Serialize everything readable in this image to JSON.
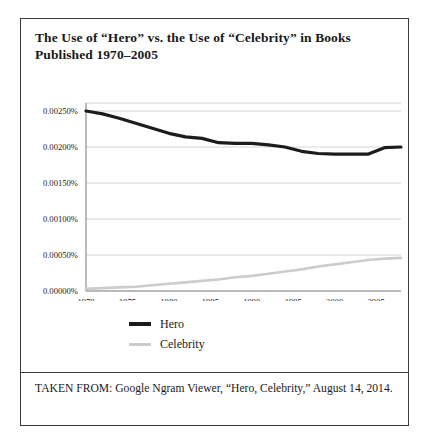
{
  "figure": {
    "title": "The Use of “Hero” vs. the Use of “Celebrity” in Books Published 1970–2005",
    "source_note": "TAKEN FROM: Google Ngram Viewer, “Hero, Celebrity,” August 14, 2014."
  },
  "legend": {
    "items": [
      {
        "label": "Hero",
        "color": "#1c1c1c"
      },
      {
        "label": "Celebrity",
        "color": "#cccccc"
      }
    ]
  },
  "chart_data": {
    "type": "line",
    "title": "The Use of “Hero” vs. the Use of “Celebrity” in Books Published 1970–2005",
    "xlabel": "",
    "ylabel": "",
    "xlim": [
      1970,
      2008
    ],
    "ylim": [
      0,
      0.0025
    ],
    "grid": true,
    "legend_position": "below-center",
    "xticks": [
      1970,
      1975,
      1980,
      1985,
      1990,
      1995,
      2000,
      2005
    ],
    "xticklabels": [
      "1970",
      "1975",
      "1980",
      "1985",
      "1990",
      "1995",
      "2000",
      "2005"
    ],
    "yticks": [
      0,
      0.0005,
      0.001,
      0.0015,
      0.002,
      0.0025
    ],
    "yticklabels": [
      "0.00000%",
      "0.00050%",
      "0.00100%",
      "0.00150%",
      "0.00200%",
      "0.00250%"
    ],
    "x": [
      1970,
      1972,
      1974,
      1976,
      1978,
      1980,
      1982,
      1984,
      1986,
      1988,
      1990,
      1992,
      1994,
      1996,
      1998,
      2000,
      2002,
      2004,
      2006,
      2008
    ],
    "series": [
      {
        "name": "Hero",
        "color": "#1c1c1c",
        "values": [
          0.0025,
          0.00246,
          0.0024,
          0.00233,
          0.00226,
          0.00219,
          0.00214,
          0.00212,
          0.00206,
          0.00205,
          0.00205,
          0.00203,
          0.002,
          0.00194,
          0.00191,
          0.0019,
          0.0019,
          0.0019,
          0.00199,
          0.002
        ]
      },
      {
        "name": "Celebrity",
        "color": "#cccccc",
        "values": [
          3e-05,
          4e-05,
          5e-05,
          6e-05,
          8e-05,
          0.0001,
          0.00012,
          0.00014,
          0.00016,
          0.00019,
          0.00021,
          0.00024,
          0.00027,
          0.0003,
          0.00034,
          0.00037,
          0.0004,
          0.00043,
          0.00045,
          0.00046
        ]
      }
    ]
  }
}
